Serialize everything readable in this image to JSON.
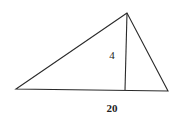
{
  "diagram": {
    "type": "triangle-with-altitude",
    "stroke_color": "#2a2a2a",
    "background": "#ffffff",
    "labels": {
      "height": "4",
      "base": "20"
    },
    "vertices": {
      "apex": [
        127,
        13
      ],
      "base_left": [
        16,
        89
      ],
      "base_right": [
        168,
        91
      ],
      "altitude_foot": [
        125,
        90
      ]
    }
  }
}
